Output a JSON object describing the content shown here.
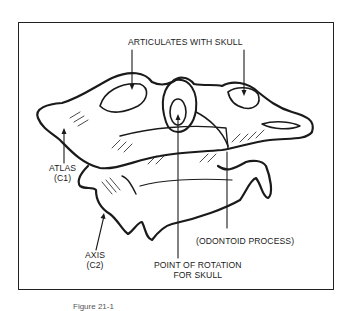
{
  "figure": {
    "labels": {
      "articulates": "ARTICULATES WITH SKULL",
      "atlas_line1": "ATLAS",
      "atlas_line2": "(C1)",
      "axis_line1": "AXIS",
      "axis_line2": "(C2)",
      "odontoid": "(ODONTOID PROCESS)",
      "rotation_line1": "POINT OF ROTATION",
      "rotation_line2": "FOR SKULL"
    },
    "caption": "Figure 21-1",
    "colors": {
      "ink": "#1a1a1a",
      "background": "#ffffff"
    }
  }
}
